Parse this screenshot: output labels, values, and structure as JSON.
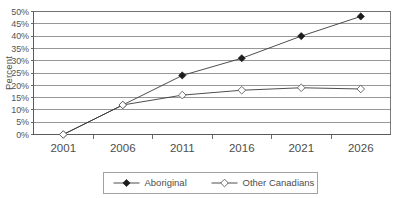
{
  "chart_data": {
    "type": "line",
    "title": "",
    "subtitle": "",
    "xlabel": "",
    "ylabel": "Percent",
    "categories": [
      "2001",
      "2006",
      "2011",
      "2016",
      "2021",
      "2026"
    ],
    "x": [
      2001,
      2006,
      2011,
      2016,
      2021,
      2026
    ],
    "ylim": [
      0,
      50
    ],
    "ytick_step": 5,
    "ytick_labels": [
      "0%",
      "5%",
      "10%",
      "15%",
      "20%",
      "25%",
      "30%",
      "35%",
      "40%",
      "45%",
      "50%"
    ],
    "ytick_values": [
      0,
      5,
      10,
      15,
      20,
      25,
      30,
      35,
      40,
      45,
      50
    ],
    "grid": "horizontal",
    "legend_position": "bottom",
    "series": [
      {
        "name": "Aboriginal",
        "marker": "filled-diamond",
        "values": [
          0,
          12,
          24,
          31,
          40,
          48
        ]
      },
      {
        "name": "Other Canadians",
        "marker": "hollow-diamond",
        "values": [
          0,
          12,
          16,
          18,
          19,
          18.5
        ]
      }
    ]
  },
  "axes": {
    "y_axis_title": "Percent"
  },
  "legend": {
    "entries": [
      {
        "label": "Aboriginal"
      },
      {
        "label": "Other Canadians"
      }
    ]
  },
  "colors": {
    "background": "#ffffff",
    "gridline": "#7d7d7d",
    "axis": "#5a5a5a",
    "series_aboriginal": "#1c1c1c",
    "series_other_canadians": "#5d5d5d",
    "text": "#4d4d4d"
  }
}
